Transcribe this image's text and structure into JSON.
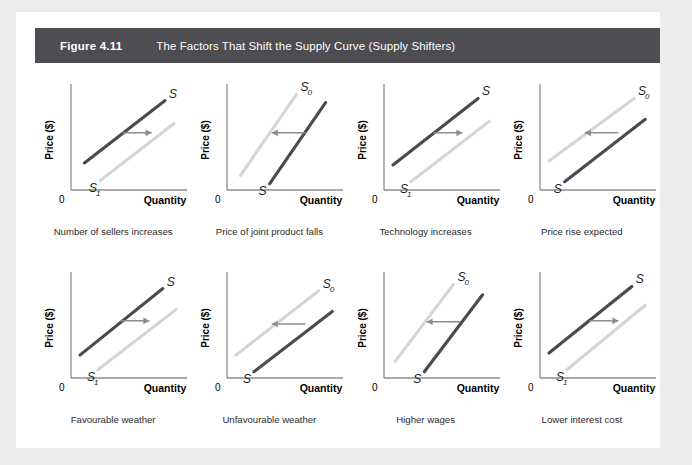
{
  "figure": {
    "number": "Figure 4.11",
    "title": "The Factors That Shift the Supply Curve (Supply Shifters)"
  },
  "colors": {
    "page_background": "#ececec",
    "card_background": "#ffffff",
    "header_bar": "#4d4d52",
    "header_text": "#ffffff",
    "dark_curve": "#4a4a4f",
    "light_curve": "#d5d5d5",
    "axis": "#8c8c8c",
    "arrow": "#8c8c8c",
    "caption_text": "#2b2b2b"
  },
  "axis_labels": {
    "y": "Price ($)",
    "x": "Quantity",
    "origin": "0"
  },
  "chart_data": {
    "type": "line",
    "title": "The Factors That Shift the Supply Curve (Supply Shifters)",
    "xlabel": "Quantity",
    "ylabel": "Price ($)",
    "xlim": [
      0,
      100
    ],
    "ylim": [
      0,
      100
    ],
    "grid": false,
    "legend": "none",
    "note": "Eight small panels; each shows an initial upward-sloping supply curve and a shifted supply curve, with an arrow indicating the direction of the shift.",
    "panels": [
      {
        "index": 1,
        "caption": "Number of sellers increases",
        "shift_direction": "right",
        "arrow": {
          "from_x": 46,
          "from_y": 55,
          "to_x": 72,
          "to_y": 55
        },
        "series": [
          {
            "name": "S",
            "label": "S",
            "label_position": "upper-right",
            "style": "dark",
            "x": [
              12,
              84
            ],
            "y": [
              26,
              86
            ]
          },
          {
            "name": "S1",
            "label": "S",
            "sublabel": "1",
            "label_position": "lower-right",
            "style": "light",
            "x": [
              26,
              92
            ],
            "y": [
              9,
              64
            ]
          }
        ]
      },
      {
        "index": 2,
        "caption": "Price of joint product falls",
        "shift_direction": "left",
        "arrow": {
          "from_x": 70,
          "from_y": 55,
          "to_x": 40,
          "to_y": 55
        },
        "series": [
          {
            "name": "S0",
            "label": "S",
            "sublabel": "0",
            "label_position": "upper-left",
            "style": "light",
            "x": [
              12,
              62
            ],
            "y": [
              14,
              92
            ]
          },
          {
            "name": "S",
            "label": "S",
            "label_position": "lower-right",
            "style": "dark",
            "x": [
              38,
              88
            ],
            "y": [
              6,
              84
            ]
          }
        ]
      },
      {
        "index": 3,
        "caption": "Technology increases",
        "shift_direction": "right",
        "arrow": {
          "from_x": 44,
          "from_y": 55,
          "to_x": 70,
          "to_y": 55
        },
        "series": [
          {
            "name": "S",
            "label": "S",
            "label_position": "upper-right",
            "style": "dark",
            "x": [
              8,
              84
            ],
            "y": [
              24,
              88
            ]
          },
          {
            "name": "S1",
            "label": "S",
            "sublabel": "1",
            "label_position": "lower-right",
            "style": "light",
            "x": [
              24,
              94
            ],
            "y": [
              8,
              66
            ]
          }
        ]
      },
      {
        "index": 4,
        "caption": "Price rise expected",
        "shift_direction": "left",
        "arrow": {
          "from_x": 70,
          "from_y": 55,
          "to_x": 40,
          "to_y": 55
        },
        "series": [
          {
            "name": "S0",
            "label": "S",
            "sublabel": "0",
            "label_position": "upper-left",
            "style": "light",
            "x": [
              8,
              84
            ],
            "y": [
              28,
              88
            ]
          },
          {
            "name": "S",
            "label": "S",
            "label_position": "lower-right",
            "style": "dark",
            "x": [
              22,
              94
            ],
            "y": [
              8,
              68
            ]
          }
        ]
      },
      {
        "index": 5,
        "caption": "Favourable weather",
        "shift_direction": "right",
        "arrow": {
          "from_x": 44,
          "from_y": 55,
          "to_x": 70,
          "to_y": 55
        },
        "series": [
          {
            "name": "S",
            "label": "S",
            "label_position": "upper-right",
            "style": "dark",
            "x": [
              8,
              82
            ],
            "y": [
              22,
              86
            ]
          },
          {
            "name": "S1",
            "label": "S",
            "sublabel": "1",
            "label_position": "lower-right",
            "style": "light",
            "x": [
              24,
              94
            ],
            "y": [
              8,
              66
            ]
          }
        ]
      },
      {
        "index": 6,
        "caption": "Unfavourable weather",
        "shift_direction": "left",
        "arrow": {
          "from_x": 70,
          "from_y": 52,
          "to_x": 40,
          "to_y": 52
        },
        "series": [
          {
            "name": "S0",
            "label": "S",
            "sublabel": "0",
            "label_position": "upper-left",
            "style": "light",
            "x": [
              8,
              82
            ],
            "y": [
              22,
              84
            ]
          },
          {
            "name": "S",
            "label": "S",
            "label_position": "lower-right",
            "style": "dark",
            "x": [
              24,
              94
            ],
            "y": [
              6,
              64
            ]
          }
        ]
      },
      {
        "index": 7,
        "caption": "Higher wages",
        "shift_direction": "left",
        "arrow": {
          "from_x": 68,
          "from_y": 54,
          "to_x": 38,
          "to_y": 54
        },
        "series": [
          {
            "name": "S0",
            "label": "S",
            "sublabel": "0",
            "label_position": "upper-left",
            "style": "light",
            "x": [
              10,
              62
            ],
            "y": [
              16,
              90
            ]
          },
          {
            "name": "S",
            "label": "S",
            "label_position": "lower-right",
            "style": "dark",
            "x": [
              36,
              88
            ],
            "y": [
              6,
              80
            ]
          }
        ]
      },
      {
        "index": 8,
        "caption": "Lower interest cost",
        "shift_direction": "right",
        "arrow": {
          "from_x": 44,
          "from_y": 55,
          "to_x": 70,
          "to_y": 55
        },
        "series": [
          {
            "name": "S",
            "label": "S",
            "label_position": "upper-right",
            "style": "dark",
            "x": [
              8,
              82
            ],
            "y": [
              24,
              88
            ]
          },
          {
            "name": "S1",
            "label": "S",
            "sublabel": "1",
            "label_position": "lower-right",
            "style": "light",
            "x": [
              24,
              94
            ],
            "y": [
              8,
              70
            ]
          }
        ]
      }
    ]
  }
}
